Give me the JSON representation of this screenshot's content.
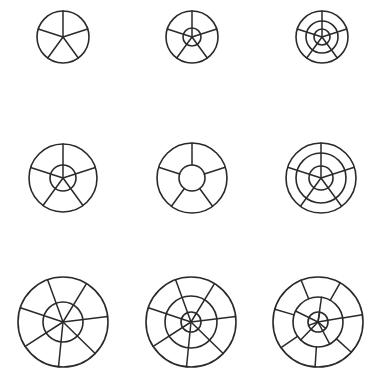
{
  "diagram": {
    "title": "",
    "stroke_color": "#2a2a2a",
    "background": "#ffffff",
    "figures": [
      {
        "id": "r1c1",
        "cx": 63,
        "cy": 37,
        "r": 26,
        "rings": [],
        "bands": [
          {
            "from": 0,
            "to": 26,
            "spokes": 5,
            "offset": 0
          }
        ]
      },
      {
        "id": "r1c2",
        "cx": 192,
        "cy": 37,
        "r": 26,
        "rings": [
          9
        ],
        "bands": [
          {
            "from": 0,
            "to": 26,
            "spokes": 5,
            "offset": 0
          }
        ]
      },
      {
        "id": "r1c3",
        "cx": 322,
        "cy": 37,
        "r": 26,
        "rings": [
          8,
          16
        ],
        "bands": [
          {
            "from": 0,
            "to": 26,
            "spokes": 5,
            "offset": 0
          }
        ]
      },
      {
        "id": "r2c1",
        "cx": 63,
        "cy": 178,
        "r": 34,
        "rings": [
          13
        ],
        "bands": [
          {
            "from": 0,
            "to": 34,
            "spokes": 5,
            "offset": 0
          }
        ]
      },
      {
        "id": "r2c2",
        "cx": 192,
        "cy": 178,
        "r": 35,
        "rings": [
          13
        ],
        "bands": [
          {
            "from": 13,
            "to": 35,
            "spokes": 5,
            "offset": 0
          }
        ]
      },
      {
        "id": "r2c3",
        "cx": 321,
        "cy": 178,
        "r": 35,
        "rings": [
          12,
          25
        ],
        "bands": [
          {
            "from": 0,
            "to": 35,
            "spokes": 5,
            "offset": 0
          }
        ]
      },
      {
        "id": "r3c1",
        "cx": 63,
        "cy": 322,
        "r": 45,
        "rings": [
          20
        ],
        "bands": [
          {
            "from": 0,
            "to": 45,
            "spokes": 7,
            "offset": -20
          }
        ]
      },
      {
        "id": "r3c2",
        "cx": 191,
        "cy": 322,
        "r": 45,
        "rings": [
          10,
          26
        ],
        "bands": [
          {
            "from": 0,
            "to": 45,
            "spokes": 7,
            "offset": -20
          }
        ]
      },
      {
        "id": "r3c3",
        "cx": 318,
        "cy": 322,
        "r": 45,
        "rings": [
          10,
          25
        ],
        "bands": [
          {
            "from": 0,
            "to": 10,
            "spokes": 3,
            "offset": 10
          },
          {
            "from": 0,
            "to": 25,
            "spokes": 5,
            "offset": 8
          },
          {
            "from": 25,
            "to": 45,
            "spokes": 7,
            "offset": -22
          }
        ]
      }
    ]
  }
}
